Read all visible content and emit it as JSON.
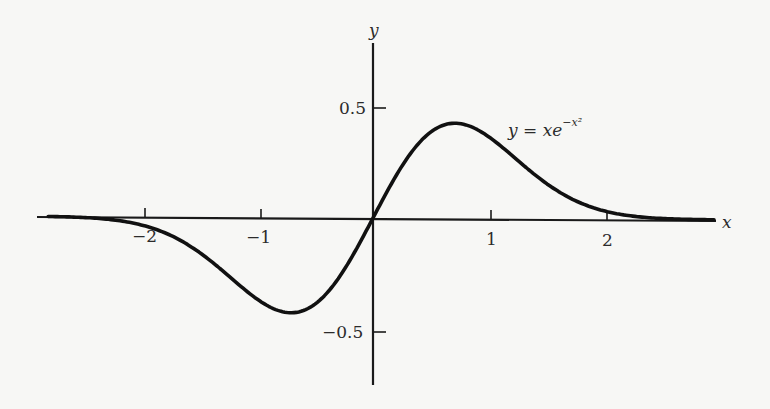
{
  "chart_data": {
    "type": "line",
    "title": "",
    "xlabel": "x",
    "ylabel": "y",
    "xlim": [
      -2.9,
      2.95
    ],
    "ylim": [
      -0.75,
      0.78
    ],
    "grid": false,
    "legend": "none",
    "x_ticks": [
      -2,
      -1,
      1,
      2
    ],
    "x_tick_labels": [
      "−2",
      "−1",
      "1",
      "2"
    ],
    "y_ticks": [
      0.5,
      -0.5
    ],
    "y_tick_labels": [
      "0.5",
      "−0.5"
    ],
    "series": [
      {
        "name": "y = xe^{-x^2}",
        "function": "x*exp(-x^2)",
        "x": [
          -2.8,
          -2.5,
          -2.0,
          -1.5,
          -1.0,
          -0.707,
          -0.5,
          -0.25,
          0,
          0.25,
          0.5,
          0.707,
          1.0,
          1.5,
          2.0,
          2.5,
          2.9
        ],
        "y": [
          -0.0011,
          -0.0048,
          -0.0366,
          -0.1581,
          -0.3679,
          -0.4289,
          -0.3894,
          -0.2352,
          0,
          0.2352,
          0.3894,
          0.4289,
          0.3679,
          0.1581,
          0.0366,
          0.0048,
          0.0006
        ]
      }
    ],
    "annotations": [
      {
        "text": "y = xe^{-x²}",
        "x": 1.3,
        "y": 0.43
      }
    ]
  },
  "labels": {
    "x_axis": "x",
    "y_axis": "y",
    "equation_lhs": "y = xe",
    "equation_exp": "−x²",
    "xtick_m2": "−2",
    "xtick_m1": "−1",
    "xtick_1": "1",
    "xtick_2": "2",
    "ytick_p05": "0.5",
    "ytick_m05": "−0.5"
  }
}
